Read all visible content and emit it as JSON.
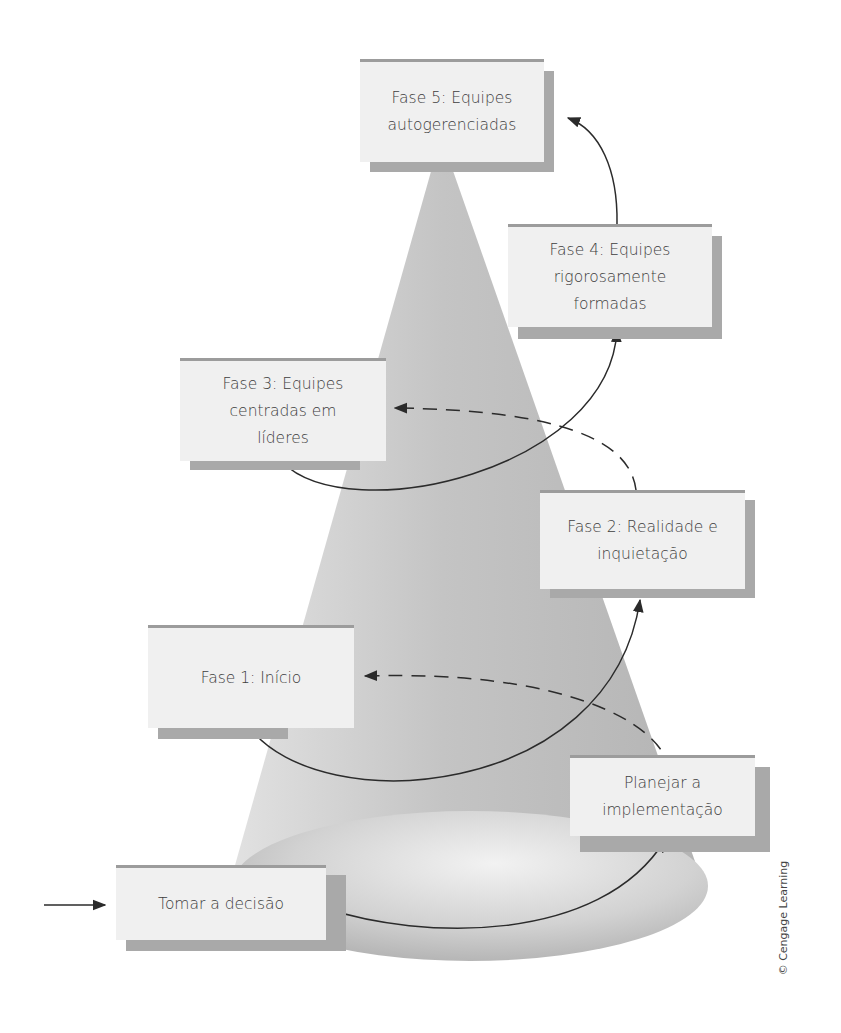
{
  "diagram": {
    "type": "cone-progression",
    "colors": {
      "box_face": "#f0f0f0",
      "box_shadow": "#a9a9a9",
      "box_topbar": "#9c9c9c",
      "cone": "#bdbdbd",
      "arrow": "#2b2b2b",
      "text": "#3e3e3e"
    },
    "stages": [
      {
        "id": "decide",
        "lines": [
          "Tomar a decisão"
        ]
      },
      {
        "id": "plan",
        "lines": [
          "Planejar a",
          "implementação"
        ]
      },
      {
        "id": "phase1",
        "lines": [
          "Fase 1: Início"
        ]
      },
      {
        "id": "phase2",
        "lines": [
          "Fase 2: Realidade e",
          "inquietação"
        ]
      },
      {
        "id": "phase3",
        "lines": [
          "Fase 3: Equipes",
          "centradas em",
          "líderes"
        ]
      },
      {
        "id": "phase4",
        "lines": [
          "Fase 4: Equipes",
          "rigorosamente",
          "formadas"
        ]
      },
      {
        "id": "phase5",
        "lines": [
          "Fase 5: Equipes",
          "autogerenciadas"
        ]
      }
    ],
    "arrows": [
      {
        "from": "entry",
        "to": "decide",
        "style": "solid"
      },
      {
        "from": "decide",
        "to": "plan",
        "style": "solid"
      },
      {
        "from": "plan",
        "to": "phase1",
        "style": "dashed"
      },
      {
        "from": "phase1",
        "to": "phase2",
        "style": "solid"
      },
      {
        "from": "phase2",
        "to": "phase3",
        "style": "dashed"
      },
      {
        "from": "phase3",
        "to": "phase4",
        "style": "solid"
      },
      {
        "from": "phase4",
        "to": "phase5",
        "style": "solid"
      }
    ],
    "credit": "© Cengage Learning"
  }
}
